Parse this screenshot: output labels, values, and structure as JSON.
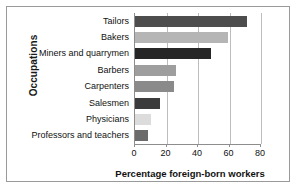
{
  "chart_data": {
    "type": "bar",
    "orientation": "horizontal",
    "title": "",
    "xlabel": "Percentage foreign-born workers",
    "ylabel": "Occupations",
    "categories": [
      "Tailors",
      "Bakers",
      "Miners and quarrymen",
      "Barbers",
      "Carpenters",
      "Salesmen",
      "Physicians",
      "Professors and teachers"
    ],
    "values": [
      71,
      59,
      48,
      26,
      25,
      16,
      10,
      8
    ],
    "bar_colors": [
      "#4d4d4d",
      "#b5b5b5",
      "#262626",
      "#9e9e9e",
      "#8a8a8a",
      "#3b3b3b",
      "#dcdcdc",
      "#6b6b6b"
    ],
    "xlim": [
      0,
      80
    ],
    "ylim": null,
    "xticks": [
      0,
      20,
      40,
      60,
      80
    ],
    "xtick_labels": [
      "0",
      "20",
      "40",
      "60",
      "80"
    ],
    "grid": "vertical",
    "legend": null,
    "axis_color": "#8d8d8d",
    "grid_color": "#bdbdbd",
    "frame_color": "#9a9a9a",
    "background": "#ffffff"
  }
}
